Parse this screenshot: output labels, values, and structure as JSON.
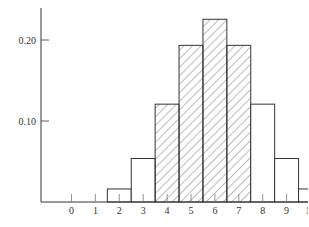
{
  "chart_data": {
    "type": "bar",
    "title": "",
    "xlabel": "",
    "ylabel": "",
    "categories": [
      "0",
      "1",
      "2",
      "3",
      "4",
      "5",
      "6",
      "7",
      "8",
      "9",
      "10",
      "11",
      "12"
    ],
    "values": [
      0.0002,
      0.0029,
      0.0161,
      0.0537,
      0.1208,
      0.1934,
      0.2256,
      0.1934,
      0.1208,
      0.0537,
      0.0161,
      0.0029,
      0.0002
    ],
    "shaded_categories": [
      "4",
      "5",
      "6",
      "7"
    ],
    "yticks": [
      0.1,
      0.2
    ],
    "ytick_labels": [
      "0.10",
      "0.20"
    ],
    "ylim": [
      0,
      0.25
    ],
    "grid": false,
    "legend": null,
    "colors": {
      "stroke": "#333333",
      "hatch": "#555555",
      "background": "#ffffff"
    }
  }
}
